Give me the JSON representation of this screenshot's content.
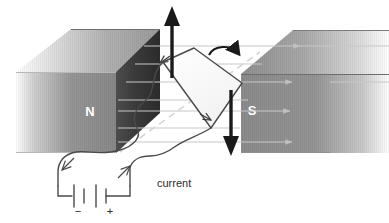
{
  "diagram": {
    "magnets": {
      "north": {
        "label": "N",
        "label_color": "#ffffff",
        "face_color": "#3a3a3a",
        "side_color": "#8a8a8a",
        "top_color": "#b4b4b4"
      },
      "south": {
        "label": "S",
        "label_color": "#ffffff",
        "face_color": "#8a8a8a",
        "top_color": "#9a9a9a"
      }
    },
    "field": {
      "name": "magnetic-field-lines",
      "color": "#c8c8c8",
      "direction": "north-to-south",
      "line_count": 6
    },
    "coil": {
      "name": "current-loop",
      "fill": "#fbfbfb",
      "stroke": "#4a4a4a",
      "axis_color": "#d0d0d0"
    },
    "forces": {
      "up_arrow": {
        "name": "force-arrow-up",
        "color": "#1a1a1a"
      },
      "down_arrow": {
        "name": "force-arrow-down",
        "color": "#1a1a1a"
      },
      "rotation_arrow": {
        "name": "rotation-arrow",
        "color": "#1a1a1a",
        "sense": "clockwise"
      }
    },
    "circuit": {
      "current_label": "current",
      "battery": {
        "name": "battery-symbol",
        "negative_terminal": "−",
        "positive_terminal": "+",
        "cell_count": 2,
        "wire_color": "#4a4a4a"
      }
    }
  }
}
